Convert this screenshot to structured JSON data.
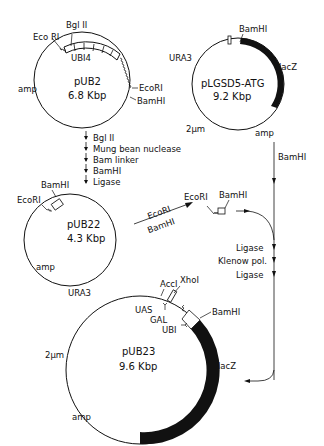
{
  "diagram": {
    "type": "plasmid-construction-scheme",
    "plasmids": [
      {
        "id": "pUB2",
        "name": "pUB2",
        "size": "6.8 Kbp",
        "labels": [
          "Eco RI",
          "Bgl II",
          "UBI4",
          "EcoRI",
          "BamHI",
          "amp"
        ]
      },
      {
        "id": "pLGSD5",
        "name": "pLGSD5-ATG",
        "size": "9.2 Kbp",
        "labels": [
          "BamHI",
          "URA3",
          "lacZ",
          "2μm",
          "amp"
        ]
      },
      {
        "id": "pUB22",
        "name": "pUB22",
        "size": "4.3 Kbp",
        "labels": [
          "BamHI",
          "EcoRI",
          "amp"
        ]
      },
      {
        "id": "pUB23",
        "name": "pUB23",
        "size": "9.6 Kbp",
        "labels": [
          "URA3",
          "AccI",
          "XhoI",
          "UAS",
          "GAL",
          "UBI",
          "BamHI",
          "2μm",
          "lacZ",
          "amp"
        ]
      }
    ],
    "steps_pUB2_to_pUB22": [
      "Bgl II",
      "Mung bean nuclease",
      "Bam linker",
      "BamHI",
      "Ligase"
    ],
    "arrow_pUB22_digest": [
      "EcoRI",
      "BamHI"
    ],
    "fragment_labels": [
      "EcoRI",
      "BamHI"
    ],
    "pLGSD5_digest": "BamHI",
    "steps_to_pUB23": [
      "Ligase",
      "Klenow pol.",
      "Ligase"
    ]
  },
  "p1": {
    "ecori1": "Eco RI",
    "bgl": "Bgl II",
    "ubi4": "UBI4",
    "ecori2": "EcoRI",
    "bamhi": "BamHI",
    "amp": "amp",
    "name": "pUB2",
    "size": "6.8 Kbp"
  },
  "p2": {
    "bamhi": "BamHI",
    "ura3": "URA3",
    "lacz": "lacZ",
    "twomu": "2μm",
    "amp": "amp",
    "name": "pLGSD5-ATG",
    "size": "9.2 Kbp"
  },
  "steps1": [
    "Bgl II",
    "Mung bean nuclease",
    "Bam linker",
    "BamHI",
    "Ligase"
  ],
  "p3": {
    "bamhi": "BamHI",
    "ecori": "EcoRI",
    "amp": "amp",
    "name": "pUB22",
    "size": "4.3 Kbp"
  },
  "arrow3": {
    "top": "EcoRI",
    "bottom": "BamHI"
  },
  "frag": {
    "ecori": "EcoRI",
    "bamhi": "BamHI"
  },
  "digest2": "BamHI",
  "steps2": [
    "Ligase",
    "Klenow pol.",
    "Ligase"
  ],
  "p4": {
    "ura3": "URA3",
    "acc": "AccI",
    "xho": "XhoI",
    "uas": "UAS",
    "gal": "GAL",
    "ubi": "UBI",
    "bamhi": "BamHI",
    "twomu": "2μm",
    "lacz": "lacZ",
    "amp": "amp",
    "name": "pUB23",
    "size": "9.6 Kbp"
  }
}
